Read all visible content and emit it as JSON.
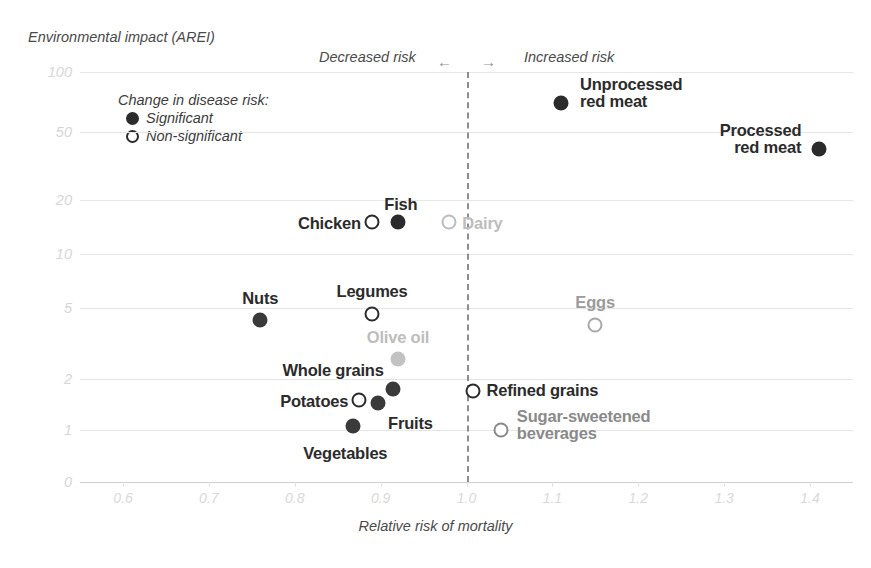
{
  "axes": {
    "y_title": "Environmental impact (AREI)",
    "x_title": "Relative risk of mortality",
    "y_ticks": [
      "100",
      "50",
      "20",
      "10",
      "5",
      "2",
      "1",
      "0"
    ],
    "x_ticks": [
      "0.6",
      "0.7",
      "0.8",
      "0.9",
      "1.0",
      "1.1",
      "1.2",
      "1.3",
      "1.4"
    ]
  },
  "annotations": {
    "decreased_risk": "Decreased risk",
    "increased_risk": "Increased risk",
    "arrow_left": "←",
    "arrow_right": "→"
  },
  "legend": {
    "title": "Change in disease risk:",
    "significant": "Significant",
    "non_significant": "Non-significant"
  },
  "colors": {
    "dark": "#2b2b2b",
    "mid_gray": "#8a8a8a",
    "light_gray": "#bdbdbd",
    "grid": "#e6e6e6",
    "tick_text": "#d6d6d6",
    "axis_text": "#4a4a4a",
    "zero_line": "#8d8d8d"
  },
  "chart_data": {
    "type": "scatter",
    "title": "",
    "xlabel": "Relative risk of mortality",
    "ylabel": "Environmental impact (AREI)",
    "xlim": [
      0.55,
      1.45
    ],
    "ylim": [
      0,
      130
    ],
    "yscale": "log-like",
    "grid": true,
    "legend_position": "top-left-inside",
    "reference_line_x": 1.0,
    "points": [
      {
        "label": "Unprocessed\nred meat",
        "x": 1.11,
        "y": 70,
        "significance": "Significant",
        "marker": "filled",
        "color": "#2b2b2b",
        "label_color": "#2b2b2b",
        "label_pos": "right"
      },
      {
        "label": "Processed\nred meat",
        "x": 1.41,
        "y": 40,
        "significance": "Significant",
        "marker": "filled",
        "color": "#2b2b2b",
        "label_color": "#2b2b2b",
        "label_pos": "left"
      },
      {
        "label": "Chicken",
        "x": 0.89,
        "y": 15,
        "significance": "Non-significant",
        "marker": "open",
        "color": "#2b2b2b",
        "label_color": "#2b2b2b",
        "label_pos": "left"
      },
      {
        "label": "Fish",
        "x": 0.92,
        "y": 15,
        "significance": "Significant",
        "marker": "filled",
        "color": "#2b2b2b",
        "label_color": "#2b2b2b",
        "label_pos": "above"
      },
      {
        "label": "Dairy",
        "x": 0.98,
        "y": 15,
        "significance": "Non-significant",
        "marker": "open",
        "color": "#bdbdbd",
        "label_color": "#bdbdbd",
        "label_pos": "right"
      },
      {
        "label": "Nuts",
        "x": 0.76,
        "y": 4.3,
        "significance": "Significant",
        "marker": "filled",
        "color": "#3a3a3a",
        "label_color": "#2b2b2b",
        "label_pos": "above"
      },
      {
        "label": "Legumes",
        "x": 0.89,
        "y": 4.6,
        "significance": "Non-significant",
        "marker": "open",
        "color": "#2b2b2b",
        "label_color": "#2b2b2b",
        "label_pos": "above"
      },
      {
        "label": "Olive oil",
        "x": 0.92,
        "y": 2.6,
        "significance": "Significant",
        "marker": "filled",
        "color": "#c2c2c2",
        "label_color": "#bdbdbd",
        "label_pos": "above"
      },
      {
        "label": "Eggs",
        "x": 1.15,
        "y": 4.0,
        "significance": "Non-significant",
        "marker": "open",
        "color": "#a8a8a8",
        "label_color": "#9b9b9b",
        "label_pos": "above"
      },
      {
        "label": "Whole grains",
        "x": 0.915,
        "y": 1.75,
        "significance": "Significant",
        "marker": "filled",
        "color": "#3a3a3a",
        "label_color": "#2b2b2b",
        "label_pos": "left-above"
      },
      {
        "label": "Potatoes",
        "x": 0.875,
        "y": 1.5,
        "significance": "Non-significant",
        "marker": "open",
        "color": "#2b2b2b",
        "label_color": "#2b2b2b",
        "label_pos": "left"
      },
      {
        "label": "Fruits",
        "x": 0.897,
        "y": 1.45,
        "significance": "Significant",
        "marker": "filled",
        "color": "#3a3a3a",
        "label_color": "#2b2b2b",
        "label_pos": "below-right"
      },
      {
        "label": "Vegetables",
        "x": 0.868,
        "y": 1.05,
        "significance": "Significant",
        "marker": "filled",
        "color": "#3a3a3a",
        "label_color": "#2b2b2b",
        "label_pos": "below"
      },
      {
        "label": "Refined grains",
        "x": 1.007,
        "y": 1.7,
        "significance": "Non-significant",
        "marker": "open",
        "color": "#2b2b2b",
        "label_color": "#2b2b2b",
        "label_pos": "right"
      },
      {
        "label": "Sugar-sweetened\nbeverages",
        "x": 1.04,
        "y": 1.0,
        "significance": "Non-significant",
        "marker": "open",
        "color": "#8a8a8a",
        "label_color": "#8a8a8a",
        "label_pos": "right"
      }
    ]
  }
}
